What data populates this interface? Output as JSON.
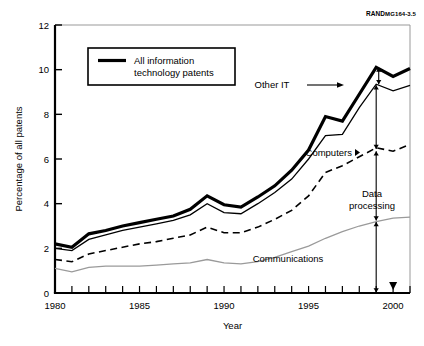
{
  "source_note": {
    "brand": "RAND",
    "code": "MG164-3.5"
  },
  "legend": {
    "label_line1": "All information",
    "label_line2": "technology patents",
    "swatch_color": "#000000"
  },
  "axes": {
    "ylabel": "Percentage of all patents",
    "xlabel": "Year",
    "yticks": [
      "0",
      "2",
      "4",
      "6",
      "8",
      "10",
      "12"
    ],
    "xticks": [
      "1980",
      "1985",
      "1990",
      "1995",
      "2000"
    ]
  },
  "annotations": [
    {
      "name": "other-it",
      "text": "Other IT"
    },
    {
      "name": "computers",
      "text": "Computers"
    },
    {
      "name": "data-processing",
      "text_line1": "Data",
      "text_line2": "processing"
    },
    {
      "name": "communications",
      "text": "Communications"
    }
  ],
  "chart_data": {
    "type": "line",
    "title": "",
    "xlabel": "Year",
    "ylabel": "Percentage of all patents",
    "xlim": [
      1980,
      2001
    ],
    "ylim": [
      0,
      12
    ],
    "grid": false,
    "legend_position": "upper-left-inset",
    "x": [
      1980,
      1981,
      1982,
      1983,
      1984,
      1985,
      1986,
      1987,
      1988,
      1989,
      1990,
      1991,
      1992,
      1993,
      1994,
      1995,
      1996,
      1997,
      1998,
      1999,
      2000,
      2001
    ],
    "series": [
      {
        "name": "All information technology patents",
        "style": "thick-solid",
        "color": "#000000",
        "values": [
          2.2,
          2.05,
          2.65,
          2.8,
          3.0,
          3.15,
          3.3,
          3.45,
          3.75,
          4.35,
          3.95,
          3.85,
          4.3,
          4.8,
          5.5,
          6.4,
          7.9,
          7.7,
          8.9,
          10.1,
          9.7,
          10.05
        ]
      },
      {
        "name": "Computers (cumulative upper)",
        "style": "thin-solid",
        "color": "#000000",
        "values": [
          2.0,
          1.9,
          2.4,
          2.6,
          2.8,
          2.95,
          3.1,
          3.25,
          3.5,
          4.0,
          3.6,
          3.55,
          4.0,
          4.5,
          5.1,
          6.0,
          7.05,
          7.1,
          8.3,
          9.35,
          9.05,
          9.3
        ]
      },
      {
        "name": "Data processing (cumulative upper)",
        "style": "dashed",
        "color": "#000000",
        "values": [
          1.5,
          1.4,
          1.75,
          1.9,
          2.05,
          2.2,
          2.3,
          2.45,
          2.6,
          2.95,
          2.7,
          2.7,
          2.95,
          3.3,
          3.7,
          4.35,
          5.4,
          5.7,
          6.1,
          6.5,
          6.35,
          6.65
        ]
      },
      {
        "name": "Communications (cumulative upper)",
        "style": "light-solid",
        "color": "#999999",
        "values": [
          1.1,
          0.95,
          1.15,
          1.2,
          1.2,
          1.2,
          1.25,
          1.3,
          1.35,
          1.5,
          1.35,
          1.3,
          1.4,
          1.6,
          1.85,
          2.1,
          2.45,
          2.75,
          3.0,
          3.2,
          3.35,
          3.4
        ]
      }
    ]
  }
}
